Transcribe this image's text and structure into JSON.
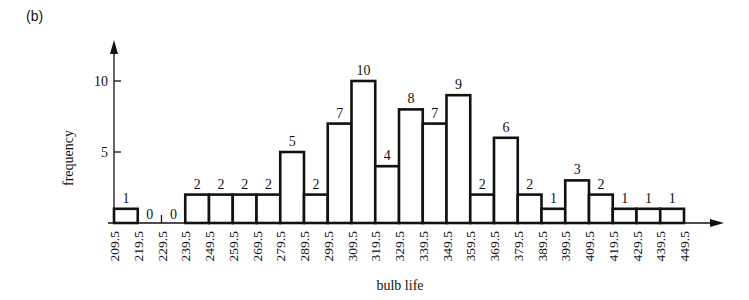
{
  "panel_label": "(b)",
  "chart_data": {
    "type": "bar",
    "subtype": "histogram",
    "title": "",
    "xlabel": "bulb life",
    "ylabel": "frequency",
    "bin_edges": [
      209.5,
      219.5,
      229.5,
      239.5,
      249.5,
      259.5,
      269.5,
      279.5,
      289.5,
      299.5,
      309.5,
      319.5,
      329.5,
      339.5,
      349.5,
      359.5,
      369.5,
      379.5,
      389.5,
      399.5,
      409.5,
      419.5,
      429.5,
      439.5,
      449.5
    ],
    "categories": [
      "209.5-219.5",
      "219.5-229.5",
      "229.5-239.5",
      "239.5-249.5",
      "249.5-259.5",
      "259.5-269.5",
      "269.5-279.5",
      "279.5-289.5",
      "289.5-299.5",
      "299.5-309.5",
      "309.5-319.5",
      "319.5-329.5",
      "329.5-339.5",
      "339.5-349.5",
      "349.5-359.5",
      "359.5-369.5",
      "369.5-379.5",
      "379.5-389.5",
      "389.5-399.5",
      "399.5-409.5",
      "409.5-419.5",
      "419.5-429.5",
      "429.5-439.5",
      "439.5-449.5"
    ],
    "values": [
      1,
      0,
      0,
      2,
      2,
      2,
      2,
      5,
      2,
      7,
      10,
      4,
      8,
      7,
      9,
      2,
      6,
      2,
      1,
      3,
      2,
      1,
      1,
      1
    ],
    "yticks": [
      5,
      10
    ],
    "ylim": [
      0,
      12
    ],
    "grid": false,
    "legend": null
  }
}
